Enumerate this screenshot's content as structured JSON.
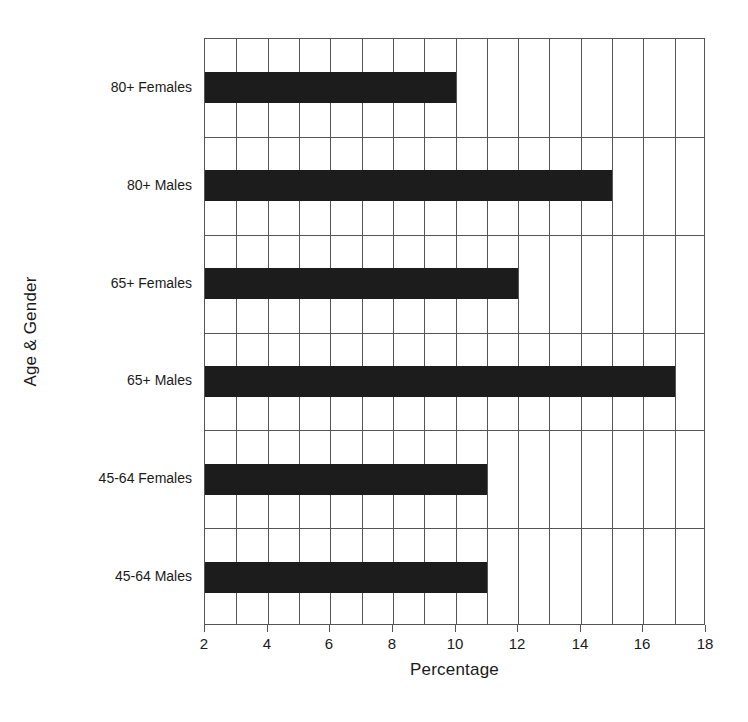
{
  "chart_data": {
    "type": "bar",
    "orientation": "horizontal",
    "title": "",
    "xlabel": "Percentage",
    "ylabel": "Age & Gender",
    "categories": [
      "80+ Females",
      "80+ Males",
      "65+ Females",
      "65+ Males",
      "45-64 Females",
      "45-64 Males"
    ],
    "values": [
      10,
      15,
      12,
      17,
      11,
      11
    ],
    "xlim": [
      2,
      18
    ],
    "xticks": [
      2,
      4,
      6,
      8,
      10,
      12,
      14,
      16,
      18
    ],
    "xtick_labels": [
      "2",
      "4",
      "6",
      "8",
      "10",
      "12",
      "14",
      "16",
      "18"
    ],
    "minor_gridline_step": 1,
    "grid": "both",
    "legend": "none",
    "bar_color": "#1c1c1c",
    "gridline_color": "#555555",
    "background_color": "#ffffff"
  }
}
